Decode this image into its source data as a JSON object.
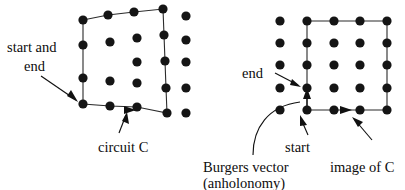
{
  "figure": {
    "panels": [
      {
        "id": "left-panel",
        "name": "perfect-crystal-circuit",
        "labels": {
          "start_and_end": "start and\nend",
          "start_and_end_line1": "start and",
          "start_and_end_line2": "end",
          "circuit": "circuit C"
        },
        "lattice": {
          "description": "distorted square lattice of filled dots",
          "dots": [
            [
              83,
              20
            ],
            [
              108,
              15
            ],
            [
              134,
              12
            ],
            [
              163,
              9
            ],
            [
              186,
              16
            ],
            [
              83,
              45
            ],
            [
              110,
              42
            ],
            [
              137,
              38
            ],
            [
              163,
              35
            ],
            [
              186,
              38
            ],
            [
              83,
              78
            ],
            [
              110,
              81
            ],
            [
              137,
              62
            ],
            [
              163,
              61
            ],
            [
              186,
              61
            ],
            [
              83,
              103
            ],
            [
              110,
              106
            ],
            [
              137,
              82
            ],
            [
              163,
              88
            ],
            [
              186,
              88
            ],
            [
              137,
              106
            ],
            [
              163,
              113
            ],
            [
              186,
              113
            ]
          ],
          "circuit_vertices": [
            [
              83,
              20
            ],
            [
              108,
              15
            ],
            [
              134,
              12
            ],
            [
              163,
              9
            ],
            [
              163,
              35
            ],
            [
              163,
              61
            ],
            [
              163,
              88
            ],
            [
              163,
              113
            ],
            [
              137,
              106
            ],
            [
              110,
              106
            ],
            [
              83,
              103
            ],
            [
              83,
              78
            ],
            [
              83,
              45
            ],
            [
              83,
              20
            ]
          ],
          "direction_marker": "triangle-right-on-bottom-edge"
        }
      },
      {
        "id": "right-panel",
        "name": "dislocated-crystal-circuit",
        "labels": {
          "end": "end",
          "start": "start",
          "burgers_line1": "Burgers vector",
          "burgers_line2": "(anholonomy)",
          "image_of_c": "image of C"
        },
        "lattice": {
          "description": "regular 5 by 5 square lattice of filled dots",
          "columns_x": [
            280,
            307,
            334,
            360,
            387
          ],
          "rows_y": [
            21,
            43,
            65,
            88,
            110
          ],
          "circuit_rect": {
            "x0": 307,
            "y0": 21,
            "x1": 387,
            "y1": 110
          },
          "gap_note": "circuit does not close: start at (307,110), end at (307,88)",
          "burgers_vector": {
            "from": [
              307,
              110
            ],
            "to": [
              307,
              88
            ]
          },
          "direction_marker": "triangle-right-on-bottom-edge"
        }
      }
    ],
    "colors": {
      "background": "#ffffff",
      "dot": "#151515",
      "line": "#2b2b2b",
      "text": "#0d0d0d",
      "leader": "#111111"
    }
  }
}
